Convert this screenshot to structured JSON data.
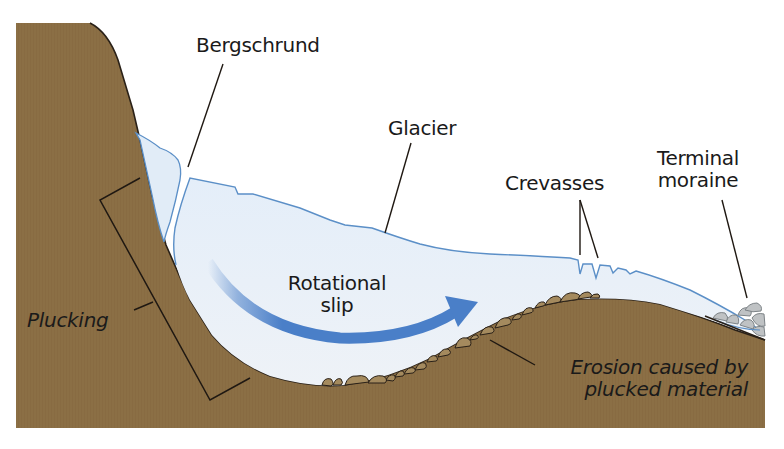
{
  "diagram": {
    "labels": {
      "bergschrund": "Bergschrund",
      "glacier": "Glacier",
      "crevasses": "Crevasses",
      "terminal_moraine_line1": "Terminal",
      "terminal_moraine_line2": "moraine",
      "rotational_slip_line1": "Rotational",
      "rotational_slip_line2": "slip",
      "plucking": "Plucking",
      "erosion_line1": "Erosion caused by",
      "erosion_line2": "plucked material"
    },
    "colors": {
      "rock": "#8b6f45",
      "rock_outline": "#2a2118",
      "ice": "#e1ecf7",
      "ice_outline": "#5b8fc7",
      "arrow": "#4a7fc8",
      "debris": "#a48a5e",
      "moraine": "#bfc2c4",
      "text": "#1a1a1a",
      "background": "#ffffff"
    }
  }
}
